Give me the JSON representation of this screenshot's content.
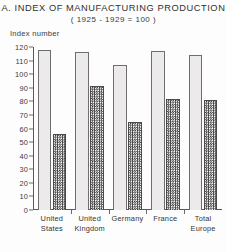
{
  "chart_data": {
    "type": "bar",
    "title": "A. INDEX OF MANUFACTURING PRODUCTION",
    "subtitle": "( 1925 - 1929 = 100 )",
    "xlabel": "",
    "ylabel": "Index number",
    "ylim": [
      0,
      120
    ],
    "yticks": [
      0,
      10,
      20,
      30,
      40,
      50,
      60,
      70,
      80,
      90,
      100,
      110,
      120
    ],
    "ytick_labels": [
      "0",
      "10",
      "20",
      "30",
      "40",
      "50",
      "60",
      "70",
      "80",
      "90",
      "100",
      "110",
      "120"
    ],
    "grid": false,
    "legend": "none",
    "categories": [
      "United States",
      "United Kingdom",
      "Germany",
      "France",
      "Total Europe"
    ],
    "category_lines": [
      [
        "United",
        "States"
      ],
      [
        "United",
        "Kingdom"
      ],
      [
        "Germany",
        ""
      ],
      [
        "France",
        ""
      ],
      [
        "Total",
        "Europe"
      ]
    ],
    "series": [
      {
        "name": "light-bar",
        "fill": "light",
        "values": [
          118,
          116,
          107,
          117,
          114
        ]
      },
      {
        "name": "dark-bar",
        "fill": "checkered",
        "values": [
          56,
          91,
          65,
          82,
          81
        ]
      }
    ]
  },
  "colors": {
    "light_bar_fill": "#eceaea",
    "light_bar_edge": "#6e6e6e",
    "dark_bar_ink": "#3b3b3b",
    "dark_bar_edge": "#4a4a4a",
    "axis": "#5a5a5a",
    "text": "#303030",
    "background": "#fdfdfd"
  }
}
